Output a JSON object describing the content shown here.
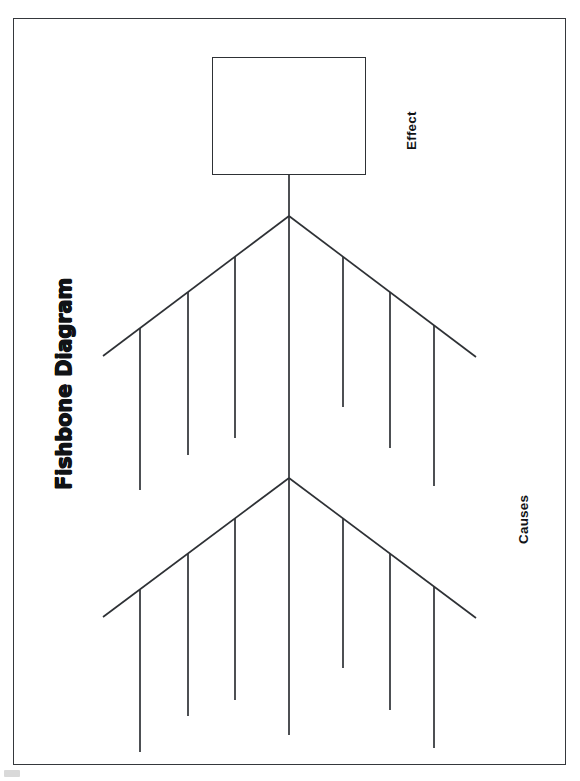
{
  "document": {
    "title": "Fishbone Diagram",
    "orientation": "portrait",
    "page_background": "#ffffff",
    "frame_color": "#35383c",
    "ink_color": "#2e3135"
  },
  "labels": {
    "title": "Fishbone Diagram",
    "effect": "Effect",
    "causes": "Causes"
  },
  "effect_box": {
    "text": "",
    "placeholder": ""
  },
  "diagram": {
    "type": "fishbone",
    "spine": {
      "x": 289,
      "y_top": 175,
      "y_bottom": 735
    },
    "junctions": [
      {
        "vertex_x": 289,
        "vertex_y": 216
      },
      {
        "vertex_x": 289,
        "vertex_y": 478
      }
    ],
    "bones_per_side": 3,
    "sides": [
      "left",
      "right"
    ],
    "total_bone_slots": 12
  }
}
